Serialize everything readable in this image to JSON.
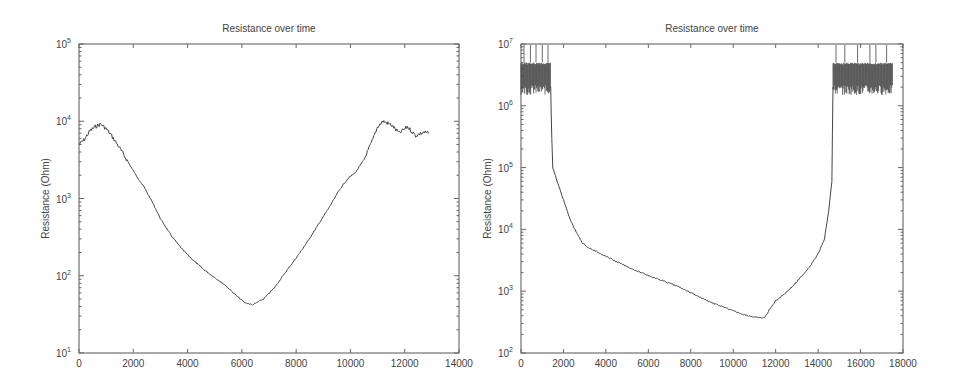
{
  "chart_data": [
    {
      "type": "line",
      "title": "Resistance over time",
      "xlabel": "",
      "ylabel": "Resistance (Ohm)",
      "xlim": [
        0,
        14000
      ],
      "ylim": [
        10,
        100000
      ],
      "yscale": "log",
      "grid": false,
      "xticks": [
        "0",
        "2000",
        "4000",
        "6000",
        "8000",
        "10000",
        "12000",
        "14000"
      ],
      "yticks": [
        {
          "base": "10",
          "exp": "1"
        },
        {
          "base": "10",
          "exp": "2"
        },
        {
          "base": "10",
          "exp": "3"
        },
        {
          "base": "10",
          "exp": "4"
        },
        {
          "base": "10",
          "exp": "5"
        }
      ],
      "series": [
        {
          "name": "Resistance",
          "x": [
            0,
            200,
            400,
            600,
            800,
            1000,
            1200,
            1500,
            1800,
            2100,
            2400,
            2700,
            3000,
            3400,
            3800,
            4200,
            4600,
            5000,
            5400,
            5800,
            6100,
            6400,
            6800,
            7200,
            7600,
            8000,
            8400,
            8800,
            9200,
            9600,
            9900,
            10200,
            10500,
            10800,
            11000,
            11200,
            11500,
            11800,
            12100,
            12400,
            12700,
            12900
          ],
          "y": [
            5000,
            5800,
            7500,
            8500,
            9200,
            8000,
            6500,
            4500,
            3000,
            2000,
            1400,
            900,
            550,
            330,
            220,
            160,
            120,
            95,
            75,
            55,
            45,
            42,
            50,
            70,
            110,
            170,
            270,
            450,
            750,
            1300,
            1800,
            2200,
            3200,
            5500,
            8500,
            10000,
            9000,
            7000,
            8500,
            6500,
            7200,
            7000
          ]
        }
      ]
    },
    {
      "type": "line",
      "title": "Resistance over time",
      "xlabel": "",
      "ylabel": "Resistance (Ohm)",
      "xlim": [
        0,
        18000
      ],
      "ylim": [
        100,
        10000000
      ],
      "yscale": "log",
      "grid": false,
      "xticks": [
        "0",
        "2000",
        "4000",
        "6000",
        "8000",
        "10000",
        "12000",
        "14000",
        "16000",
        "18000"
      ],
      "yticks": [
        {
          "base": "10",
          "exp": "2"
        },
        {
          "base": "10",
          "exp": "3"
        },
        {
          "base": "10",
          "exp": "4"
        },
        {
          "base": "10",
          "exp": "5"
        },
        {
          "base": "10",
          "exp": "6"
        },
        {
          "base": "10",
          "exp": "7"
        }
      ],
      "noise_bands": [
        {
          "x_start": 0,
          "x_end": 1400,
          "y_low": 1500000,
          "y_high": 5000000,
          "spikes_to": 10000000
        },
        {
          "x_start": 14700,
          "x_end": 17500,
          "y_low": 1500000,
          "y_high": 5000000,
          "spikes_to": 10000000
        }
      ],
      "series": [
        {
          "name": "Resistance",
          "x": [
            1400,
            1450,
            1500,
            1700,
            2000,
            2300,
            2600,
            2900,
            3200,
            3600,
            4000,
            4500,
            5000,
            5500,
            6000,
            6500,
            7000,
            7500,
            8000,
            8500,
            9000,
            9500,
            10000,
            10500,
            11000,
            11300,
            11500,
            11700,
            12000,
            12400,
            12800,
            13200,
            13600,
            14000,
            14300,
            14500,
            14650,
            14700
          ],
          "y": [
            2000000,
            300000,
            100000,
            60000,
            30000,
            15000,
            9000,
            6000,
            5000,
            4300,
            3700,
            3000,
            2500,
            2100,
            1800,
            1550,
            1350,
            1150,
            950,
            780,
            650,
            560,
            480,
            420,
            380,
            370,
            380,
            500,
            700,
            900,
            1200,
            1700,
            2500,
            4000,
            7000,
            20000,
            60000,
            2000000
          ]
        }
      ]
    }
  ]
}
